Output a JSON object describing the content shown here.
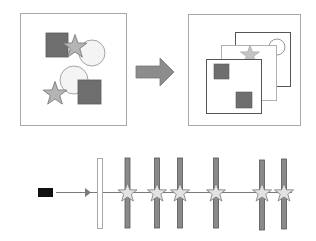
{
  "diagram": {
    "colors": {
      "background": "#ffffff",
      "panel_border": "#a8a8a8",
      "square_fill": "#6e6e6e",
      "square_stroke": "#5a5a5a",
      "star_fill": "#b4b4b4",
      "star_stroke": "#7a7a7a",
      "circle_fill": "#f4f4f4",
      "circle_stroke": "#9a9a9a",
      "arrow_fill": "#8c8c8c",
      "arrow_stroke": "#777777",
      "layer_dark": "#555555",
      "layer_light": "#b0b0b0",
      "camera": "#111111",
      "ray": "#7a7a7a",
      "plane_fill": "#8a8a8a",
      "plane_stroke": "#555555",
      "first_plane_fill": "#ffffff",
      "first_plane_stroke": "#a0a0a0",
      "sample_star_fill": "#e2e2e2",
      "sample_star_stroke": "#777777"
    },
    "scene_panel": {
      "label": "",
      "shapes": [
        "square",
        "star",
        "circle",
        "circle",
        "square",
        "star"
      ]
    },
    "transform_arrow": {
      "direction": "right"
    },
    "layers_panel": {
      "label": "",
      "layers": [
        "back-circle-layer",
        "middle-star-layer",
        "front-square-layer"
      ]
    },
    "ray_diagram": {
      "camera_icon": "camera-icon",
      "plane_count": 7,
      "sample_points": 6
    }
  }
}
